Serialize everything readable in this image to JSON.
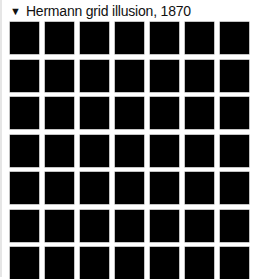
{
  "details": {
    "expanded": true,
    "toggle_icon": "triangle-down-icon",
    "toggle_glyph": "▼",
    "title": "Hermann grid illusion, 1870"
  },
  "illusion": {
    "rows": 7,
    "columns": 7,
    "square_color": "#000000",
    "background_color": "#ffffff"
  }
}
